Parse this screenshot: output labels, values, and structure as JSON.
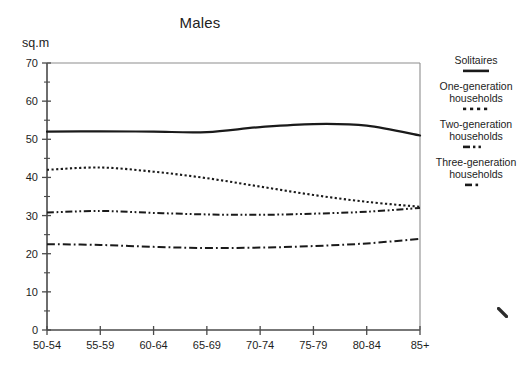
{
  "chart_data": {
    "type": "line",
    "title": "Males",
    "xlabel": "",
    "ylabel": "sq.m",
    "categories": [
      "50-54",
      "55-59",
      "60-64",
      "65-69",
      "70-74",
      "75-79",
      "80-84",
      "85+"
    ],
    "ylim": [
      0,
      70
    ],
    "y_ticks": [
      0,
      10,
      20,
      30,
      40,
      50,
      60,
      70
    ],
    "y_minor_ticks": [
      5,
      15,
      25,
      35,
      45,
      55,
      65
    ],
    "grid": false,
    "legend_position": "right",
    "series": [
      {
        "name": "Solitaires",
        "style": "solid",
        "values": [
          52.0,
          52.1,
          52.0,
          51.9,
          53.2,
          54.0,
          53.6,
          51.0
        ]
      },
      {
        "name": "One-generation households",
        "style": "dotted",
        "values": [
          42.0,
          42.6,
          41.5,
          39.8,
          37.6,
          35.4,
          33.6,
          32.3
        ]
      },
      {
        "name": "Two-generation households",
        "style": "dash-dot-dot",
        "values": [
          30.8,
          31.2,
          30.7,
          30.3,
          30.2,
          30.5,
          31.0,
          32.0
        ]
      },
      {
        "name": "Three-generation households",
        "style": "dash-dot",
        "values": [
          22.5,
          22.3,
          21.8,
          21.5,
          21.6,
          22.0,
          22.7,
          23.9
        ]
      }
    ]
  },
  "legend": {
    "entries": [
      {
        "label": "Solitaires",
        "style": "solid"
      },
      {
        "label": "One-generation households",
        "style": "dotted"
      },
      {
        "label": "Two-generation households",
        "style": "dash-dot-dot"
      },
      {
        "label": "Three-generation households",
        "style": "dash-dot"
      }
    ]
  },
  "colors": {
    "line": "#1a1a1a",
    "axis": "#4a4a4a",
    "background": "#ffffff"
  }
}
